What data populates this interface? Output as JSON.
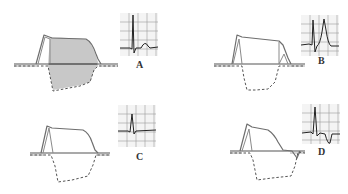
{
  "figure": {
    "colors": {
      "background": "#ffffff",
      "ap_line": "#6e6e6e",
      "gradient_fill": "#c8c8c8",
      "ecg_trace": "#222222",
      "grid": "#bdbdbd"
    },
    "panels": [
      {
        "id": "A",
        "label": "A",
        "ecg_pattern": "QRS followed by small upright T wave",
        "gradient_shaded": true
      },
      {
        "id": "B",
        "label": "B",
        "ecg_pattern": "QRS followed by tall peaked upright T wave",
        "gradient_shaded": false
      },
      {
        "id": "C",
        "label": "C",
        "ecg_pattern": "QRS with flat isoelectric T wave",
        "gradient_shaded": false
      },
      {
        "id": "D",
        "label": "D",
        "ecg_pattern": "QRS followed by inverted T wave",
        "gradient_shaded": false
      }
    ]
  }
}
